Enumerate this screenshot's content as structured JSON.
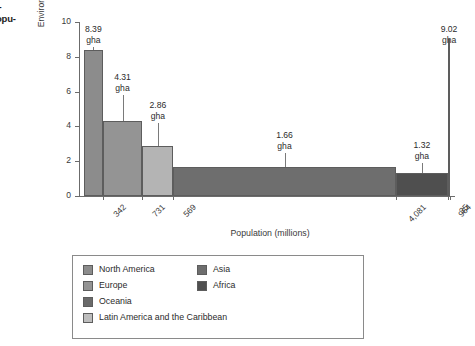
{
  "margin_caption": {
    "line1": "i-",
    "line2": "opu-"
  },
  "chart_data": {
    "type": "bar",
    "title": "",
    "xlabel": "Population (millions)",
    "ylabel": "Environmental footprint (gha per person)",
    "ylim": [
      0,
      10
    ],
    "yticks": [
      0,
      2,
      4,
      6,
      8,
      10
    ],
    "grid": false,
    "legend_position": "below-plot",
    "note": "Variable-width bar chart (mekko): bar width = population, bar height = environmental footprint",
    "categories": [
      "North America",
      "Europe",
      "Latin America and the Caribbean",
      "Asia",
      "Africa",
      "Oceania"
    ],
    "values": [
      8.39,
      4.31,
      2.86,
      1.66,
      1.32,
      9.02
    ],
    "value_labels": [
      "8.39\ngha",
      "4.31\ngha",
      "2.86\ngha",
      "1.66\ngha",
      "1.32\ngha",
      "9.02\ngha"
    ],
    "value_unit": "gha",
    "widths": [
      342,
      731,
      569,
      4081,
      964,
      35
    ],
    "width_labels": [
      "342",
      "731",
      "569",
      "4,081",
      "964",
      "35"
    ],
    "colors": [
      "#8c8c8c",
      "#949494",
      "#b4b4b4",
      "#6e6e6e",
      "#4f4f4f",
      "#808080"
    ]
  },
  "bars": [
    {
      "value": "8.39",
      "unit": "gha",
      "pop": "342",
      "color": "#8c8c8c"
    },
    {
      "value": "4.31",
      "unit": "gha",
      "pop": "731",
      "color": "#949494"
    },
    {
      "value": "2.86",
      "unit": "gha",
      "pop": "569",
      "color": "#b4b4b4"
    },
    {
      "value": "1.66",
      "unit": "gha",
      "pop": "4,081",
      "color": "#6e6e6e"
    },
    {
      "value": "1.32",
      "unit": "gha",
      "pop": "964",
      "color": "#4f4f4f"
    },
    {
      "value": "9.02",
      "unit": "gha",
      "pop": "35",
      "color": "#808080"
    }
  ],
  "yticks": [
    {
      "label": "10"
    },
    {
      "label": "8"
    },
    {
      "label": "6"
    },
    {
      "label": "4"
    },
    {
      "label": "2"
    },
    {
      "label": "0"
    }
  ],
  "legend": {
    "left_column": [
      {
        "label": "North America",
        "color": "#8c8c8c"
      },
      {
        "label": "Europe",
        "color": "#949494"
      },
      {
        "label": "Oceania",
        "color": "#6a6a6a"
      },
      {
        "label": "Latin America and the Caribbean",
        "color": "#bdbdbd"
      }
    ],
    "right_column": [
      {
        "label": "Asia",
        "color": "#6e6e6e"
      },
      {
        "label": "Africa",
        "color": "#4f4f4f"
      }
    ]
  }
}
